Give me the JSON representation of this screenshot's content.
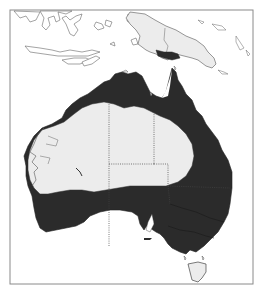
{
  "map": {
    "region": "Australia and New Guinea",
    "type": "species distribution map",
    "legend": [],
    "colors": {
      "background": "#ffffff",
      "frame": "#8a8a8a",
      "land_outline": "#555555",
      "distribution": "#2b2b2b",
      "non_distribution_land": "#ececec",
      "state_border": "#444444"
    },
    "features": [
      {
        "name": "distribution-range",
        "description": "Dark-shaded coastal ring: north, east, south-east and south-west Australia, plus southern New Guinea lowlands"
      },
      {
        "name": "arid-interior",
        "description": "Light-shaded central/western interior without records"
      },
      {
        "name": "state-borders",
        "description": "Dotted internal boundaries"
      },
      {
        "name": "tasmania",
        "description": "Outline only, light"
      },
      {
        "name": "indonesia-islands",
        "description": "Outline only"
      },
      {
        "name": "new-guinea",
        "description": "Light shaded with dark southern patch"
      }
    ]
  }
}
